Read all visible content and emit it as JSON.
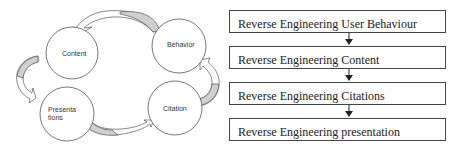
{
  "cycle_diagram": {
    "nodes": [
      {
        "id": "content",
        "label_lines": [
          "Content"
        ]
      },
      {
        "id": "behavior",
        "label_lines": [
          "Behavior"
        ]
      },
      {
        "id": "presentations",
        "label_lines": [
          "Presenta",
          "tions"
        ]
      },
      {
        "id": "citation",
        "label_lines": [
          "Citation"
        ]
      }
    ],
    "edges": [
      {
        "from": "Behavior",
        "to": "Content"
      },
      {
        "from": "Content",
        "to": "Presentations"
      },
      {
        "from": "Presentations",
        "to": "Citation"
      },
      {
        "from": "Citation",
        "to": "Behavior"
      }
    ],
    "colors": {
      "circle_stroke": "#555555",
      "arrow_fill": "#d0d0d0",
      "arrow_stroke": "#555555"
    }
  },
  "flowchart": {
    "steps": [
      {
        "label": "Reverse Engineering User Behaviour"
      },
      {
        "label": "Reverse Engineering Content"
      },
      {
        "label": "Reverse Engineering Citations"
      },
      {
        "label": "Reverse Engineering presentation"
      }
    ]
  }
}
